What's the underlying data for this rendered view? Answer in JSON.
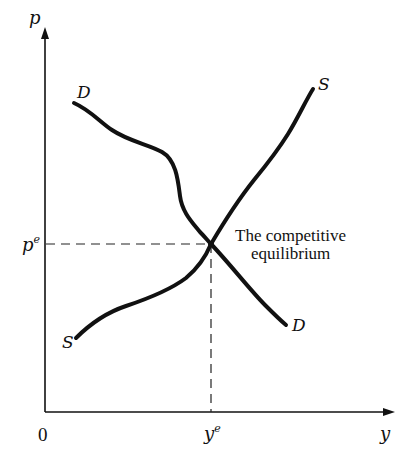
{
  "diagram": {
    "axes": {
      "y_axis_label": "p",
      "x_axis_label": "y",
      "origin_label": "0"
    },
    "equilibrium": {
      "price_label": "p",
      "price_superscript": "e",
      "quantity_label": "y",
      "quantity_superscript": "e",
      "annotation_line1": "The competitive",
      "annotation_line2": "equilibrium"
    },
    "curves": {
      "demand": {
        "name": "Demand",
        "label_start": "D",
        "label_end": "D"
      },
      "supply": {
        "name": "Supply",
        "label_start": "S",
        "label_end": "S"
      }
    },
    "colors": {
      "ink": "#111111",
      "background": "#ffffff"
    }
  }
}
